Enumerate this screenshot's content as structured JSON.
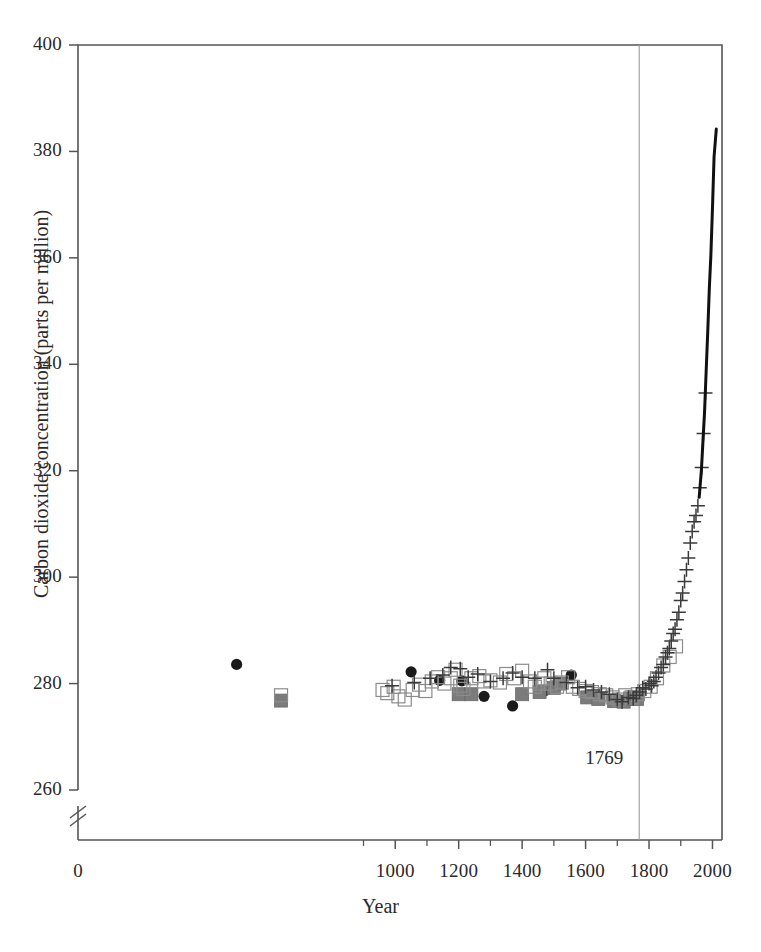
{
  "figure": {
    "background_color": "#ffffff",
    "axis_color": "#555555",
    "marker_dark": "#1a1a1a",
    "marker_gray": "#7b7b7b",
    "marker_open": "#8c8c8c",
    "guide_line_color": "#9a9a9a"
  },
  "chart_data": {
    "type": "scatter",
    "title": "",
    "subtitle": "",
    "xlabel": "Year",
    "ylabel": "Carbon dioxide concentration (parts per million)",
    "xlim": [
      0,
      2030
    ],
    "ylim": [
      260,
      400
    ],
    "y_axis_break": true,
    "y_axis_break_note": "axis broken between 0 and 260 ppm",
    "grid": false,
    "legend_position": "none",
    "x_ticks": [
      0,
      1000,
      1200,
      1400,
      1600,
      1800,
      2000
    ],
    "x_tick_labels": [
      "0",
      "1000",
      "1200",
      "1400",
      "1600",
      "1800",
      "2000"
    ],
    "x_minor_ticks": [
      900,
      1100,
      1300,
      1500,
      1700,
      1900
    ],
    "y_ticks": [
      260,
      280,
      300,
      320,
      340,
      360,
      380,
      400
    ],
    "y_tick_labels": [
      "260",
      "280",
      "300",
      "320",
      "340",
      "360",
      "380",
      "400"
    ],
    "annotations": [
      {
        "text": "1769",
        "x": 1769,
        "y": 264,
        "kind": "vertical-line-label",
        "line_from_y": 260,
        "line_to_y": 400
      }
    ],
    "series": [
      {
        "name": "ice-core-filled-circles",
        "marker": "filled-circle",
        "color": "#1a1a1a",
        "points": [
          [
            500,
            283.6
          ],
          [
            1050,
            282.2
          ],
          [
            1140,
            280.6
          ],
          [
            1210,
            280.5
          ],
          [
            1280,
            277.6
          ],
          [
            1370,
            275.8
          ],
          [
            1470,
            278.6
          ],
          [
            1555,
            281.6
          ]
        ]
      },
      {
        "name": "ice-core-gray-squares",
        "marker": "filled-square",
        "color": "#7b7b7b",
        "points": [
          [
            640,
            276.8
          ],
          [
            1200,
            278.0
          ],
          [
            1240,
            278.0
          ],
          [
            1400,
            278.0
          ],
          [
            1455,
            278.4
          ],
          [
            1500,
            279.2
          ],
          [
            1520,
            280.0
          ],
          [
            1605,
            277.4
          ],
          [
            1640,
            277.1
          ],
          [
            1690,
            276.7
          ],
          [
            1720,
            276.6
          ],
          [
            1740,
            277.2
          ],
          [
            1755,
            277.5
          ],
          [
            1762,
            277.1
          ]
        ]
      },
      {
        "name": "ice-core-open-squares",
        "marker": "open-square",
        "color": "#8c8c8c",
        "points": [
          [
            640,
            277.8
          ],
          [
            960,
            278.8
          ],
          [
            975,
            278.2
          ],
          [
            995,
            279.4
          ],
          [
            1010,
            277.6
          ],
          [
            1030,
            277.0
          ],
          [
            1055,
            278.8
          ],
          [
            1075,
            279.8
          ],
          [
            1095,
            278.6
          ],
          [
            1115,
            280.4
          ],
          [
            1135,
            281.2
          ],
          [
            1155,
            280.0
          ],
          [
            1175,
            281.0
          ],
          [
            1190,
            282.6
          ],
          [
            1205,
            279.6
          ],
          [
            1215,
            279.0
          ],
          [
            1240,
            281.0
          ],
          [
            1265,
            281.4
          ],
          [
            1280,
            280.4
          ],
          [
            1300,
            280.6
          ],
          [
            1330,
            280.2
          ],
          [
            1350,
            281.8
          ],
          [
            1375,
            281.0
          ],
          [
            1400,
            282.4
          ],
          [
            1425,
            280.4
          ],
          [
            1440,
            279.4
          ],
          [
            1455,
            280.0
          ],
          [
            1470,
            281.0
          ],
          [
            1490,
            280.0
          ],
          [
            1510,
            279.4
          ],
          [
            1525,
            280.2
          ],
          [
            1545,
            281.2
          ],
          [
            1560,
            279.4
          ],
          [
            1580,
            279.0
          ],
          [
            1600,
            278.6
          ],
          [
            1620,
            278.4
          ],
          [
            1645,
            278.0
          ],
          [
            1665,
            277.8
          ],
          [
            1685,
            277.4
          ],
          [
            1705,
            277.0
          ],
          [
            1725,
            277.8
          ],
          [
            1745,
            277.4
          ],
          [
            1765,
            278.0
          ],
          [
            1785,
            278.6
          ],
          [
            1805,
            279.4
          ],
          [
            1825,
            281.0
          ],
          [
            1845,
            283.4
          ],
          [
            1865,
            285.0
          ],
          [
            1885,
            287.0
          ]
        ]
      },
      {
        "name": "ice-core-plus-markers",
        "marker": "plus",
        "color": "#3a3a3a",
        "points": [
          [
            990,
            279.6
          ],
          [
            1060,
            280.2
          ],
          [
            1110,
            281.0
          ],
          [
            1150,
            281.6
          ],
          [
            1175,
            283.0
          ],
          [
            1205,
            282.8
          ],
          [
            1230,
            281.2
          ],
          [
            1260,
            281.8
          ],
          [
            1300,
            280.4
          ],
          [
            1340,
            281.0
          ],
          [
            1370,
            282.0
          ],
          [
            1400,
            281.2
          ],
          [
            1440,
            281.0
          ],
          [
            1480,
            282.6
          ],
          [
            1500,
            281.0
          ],
          [
            1540,
            280.2
          ],
          [
            1575,
            279.2
          ],
          [
            1600,
            279.4
          ],
          [
            1625,
            278.8
          ],
          [
            1650,
            278.4
          ],
          [
            1675,
            278.0
          ],
          [
            1700,
            277.0
          ],
          [
            1715,
            276.6
          ],
          [
            1735,
            277.4
          ],
          [
            1750,
            277.2
          ],
          [
            1760,
            277.8
          ],
          [
            1770,
            278.4
          ],
          [
            1780,
            279.2
          ],
          [
            1790,
            279.0
          ],
          [
            1800,
            280.0
          ],
          [
            1808,
            279.6
          ],
          [
            1815,
            280.4
          ],
          [
            1822,
            281.2
          ],
          [
            1830,
            282.0
          ],
          [
            1838,
            283.0
          ],
          [
            1845,
            283.6
          ],
          [
            1852,
            285.0
          ],
          [
            1858,
            285.8
          ],
          [
            1864,
            286.6
          ],
          [
            1870,
            288.0
          ],
          [
            1876,
            289.4
          ],
          [
            1882,
            290.2
          ],
          [
            1888,
            292.0
          ],
          [
            1894,
            293.4
          ],
          [
            1900,
            295.6
          ],
          [
            1906,
            297.0
          ],
          [
            1912,
            299.2
          ],
          [
            1918,
            301.4
          ],
          [
            1924,
            303.6
          ],
          [
            1930,
            306.4
          ],
          [
            1936,
            308.6
          ],
          [
            1942,
            310.4
          ],
          [
            1948,
            311.6
          ],
          [
            1954,
            313.4
          ],
          [
            1960,
            316.8
          ],
          [
            1966,
            320.6
          ],
          [
            1972,
            327.0
          ],
          [
            1978,
            334.6
          ]
        ]
      },
      {
        "name": "mauna-loa-line",
        "marker": "line",
        "color": "#111111",
        "points": [
          [
            1958,
            315.0
          ],
          [
            1965,
            320.0
          ],
          [
            1970,
            325.6
          ],
          [
            1975,
            331.0
          ],
          [
            1980,
            338.6
          ],
          [
            1985,
            346.0
          ],
          [
            1990,
            354.2
          ],
          [
            1995,
            360.6
          ],
          [
            2000,
            369.4
          ],
          [
            2005,
            379.0
          ],
          [
            2012,
            384.2
          ]
        ]
      }
    ]
  },
  "axis": {
    "x_title": "Year",
    "y_title": "Carbon dioxide concentration (parts per million)"
  },
  "labels": {
    "x_ticks": [
      "0",
      "1000",
      "1200",
      "1400",
      "1600",
      "1800",
      "2000"
    ],
    "y_ticks": [
      "400",
      "380",
      "360",
      "340",
      "320",
      "300",
      "280",
      "260"
    ],
    "annotation_year": "1769"
  }
}
